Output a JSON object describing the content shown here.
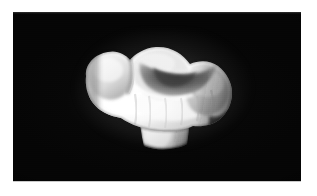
{
  "figure": {
    "domain_label": "Natural-Image",
    "kind": "grayscale-specimen-photograph",
    "caption": "",
    "view": "buccal-oblique",
    "orientation": "occlusal-surface-facing-upper-right",
    "colorspace": "grayscale",
    "background_description": "uniform black field"
  },
  "panel": {
    "name": "specimen-image-panel",
    "background_color": "#050505",
    "page_margin_color": "#ffffff",
    "left_px": 13,
    "top_px": 12,
    "width_px": 288,
    "height_px": 169
  },
  "specimen": {
    "name": "tooth-specimen",
    "highlight_color": "#fdfdfd",
    "midtone_color": "#d2d2d2",
    "shadow_color": "#6d6d6d",
    "deep_shadow_color": "#2a2a2a",
    "outline_color": "#0b0b0b",
    "bounding_box_px": {
      "x": 80,
      "y": 36,
      "width": 160,
      "height": 110
    },
    "parts": [
      {
        "name": "mesial-cusp",
        "label": "mesiobuccal cusp"
      },
      {
        "name": "distal-cusp",
        "label": "distobuccal cusp"
      },
      {
        "name": "occlusal-basin",
        "label": "central occlusal fossa"
      },
      {
        "name": "buccal-wall",
        "label": "buccal enamel wall"
      },
      {
        "name": "cervical-margin",
        "label": "cervical line"
      },
      {
        "name": "root-stem",
        "label": "root stump"
      }
    ]
  },
  "lighting": {
    "key_light_direction": "upper-left",
    "bloom": true,
    "vignette": true,
    "grain": true
  }
}
